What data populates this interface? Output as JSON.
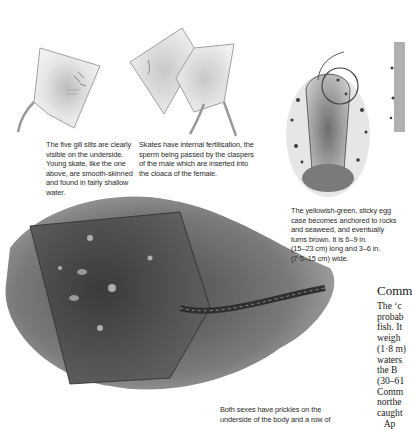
{
  "illustrations": [
    {
      "name": "young-skate-underside",
      "label": "Young skate, underside view"
    },
    {
      "name": "mating-skates",
      "label": "Pair of skates mating"
    },
    {
      "name": "egg-case",
      "label": "Egg case anchored to rocks"
    },
    {
      "name": "egg-case-partial",
      "label": "Second egg case (cropped)"
    },
    {
      "name": "common-skate",
      "label": "Common skate on seabed"
    }
  ],
  "captions": {
    "gill_slits": [
      "The five gill slits are clearly",
      "visible on the underside.",
      "Young skate, like the one",
      "above, are smooth-skinned",
      "and found in fairly shallow",
      "water."
    ],
    "fertilisation": [
      "Skates have internal fertilisation, the",
      "sperm being passed by the claspers",
      "of the male which are inserted into",
      "the cloaca of the female."
    ],
    "egg_case": [
      "The yellowish-green, sticky egg",
      "case becomes anchored to rocks",
      "and seaweed, and eventually",
      "turns brown. It is 6–9 in.",
      "(15–23 cm) long and 3–6 in.",
      "(7·5–15 cm) wide."
    ],
    "prickles": [
      "Both sexes have prickles on the",
      "underside of the body and a row of"
    ]
  },
  "article": {
    "heading": "Comm",
    "lines": [
      "The ‘c",
      "probab",
      "fish. It",
      "weigh",
      "(1·8 m)",
      "waters",
      "the  B",
      "(30–61",
      "Comm",
      "northe",
      "caught",
      "   Ap"
    ]
  }
}
